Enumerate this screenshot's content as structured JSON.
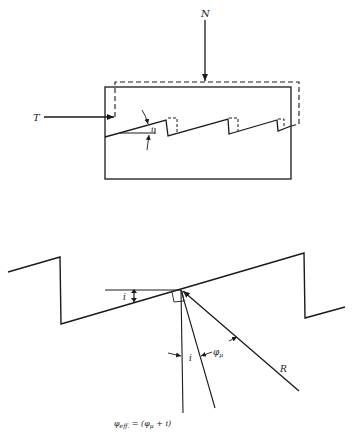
{
  "figure": {
    "top_diagram": {
      "name": "sawtooth-shear-block",
      "labels": {
        "normal_force": "N",
        "shear_force": "T",
        "asperity_angle": "i"
      }
    },
    "bottom_diagram": {
      "name": "asperity-force-resolution",
      "labels": {
        "asperity_angle": "i",
        "normal_offset_angle": "i",
        "friction_angle": "φ",
        "friction_angle_sub": "μ",
        "resultant": "R"
      },
      "equation": {
        "lhs_symbol": "φ",
        "lhs_sub": "eff.",
        "equals": " = (",
        "rhs_symbol": "φ",
        "rhs_sub": "μ",
        "rhs_tail": " + i)"
      }
    },
    "colors": {
      "ink": "#1a1a1a",
      "background": "#ffffff"
    }
  }
}
